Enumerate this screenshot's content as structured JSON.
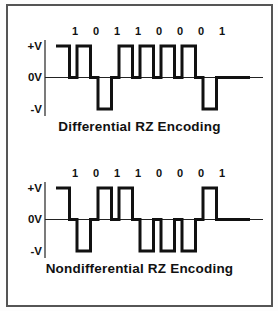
{
  "figure": {
    "background_color": "#ffffff",
    "border_color": "#555555",
    "line_color": "#111111",
    "panels": [
      {
        "title": "Differential RZ Encoding",
        "bits": [
          "1",
          "0",
          "1",
          "1",
          "0",
          "0",
          "0",
          "1"
        ],
        "pulse_polarities": [
          1,
          1,
          -1,
          1,
          1,
          1,
          1,
          -1
        ],
        "axis_labels": {
          "plus": "+V",
          "zero": "0V",
          "minus": "-V"
        }
      },
      {
        "title": "Nondifferential RZ Encoding",
        "bits": [
          "1",
          "0",
          "1",
          "1",
          "0",
          "0",
          "0",
          "1"
        ],
        "pulse_polarities": [
          1,
          -1,
          1,
          1,
          -1,
          -1,
          -1,
          1
        ],
        "axis_labels": {
          "plus": "+V",
          "zero": "0V",
          "minus": "-V"
        }
      }
    ]
  }
}
